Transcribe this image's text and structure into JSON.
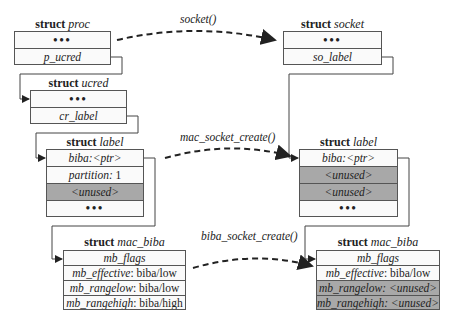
{
  "diagram": {
    "left": {
      "proc": {
        "keyword": "struct",
        "name": "proc",
        "rows": [
          {
            "text": "•••",
            "kind": "dots"
          },
          {
            "text": "p_ucred",
            "kind": "field"
          }
        ]
      },
      "ucred": {
        "keyword": "struct",
        "name": "ucred",
        "rows": [
          {
            "text": "•••",
            "kind": "dots"
          },
          {
            "text": "cr_label",
            "kind": "field"
          }
        ]
      },
      "label": {
        "keyword": "struct",
        "name": "label",
        "rows": [
          {
            "field": "biba: ",
            "value": "<ptr>",
            "kind": "field"
          },
          {
            "field": "partition:",
            "value": " 1",
            "kind": "field"
          },
          {
            "text": "<unused>",
            "kind": "shaded"
          },
          {
            "text": "•••",
            "kind": "dots"
          }
        ]
      },
      "mac_biba": {
        "keyword": "struct",
        "name": "mac_biba",
        "rows": [
          {
            "text": "mb_flags",
            "kind": "field"
          },
          {
            "field": "mb_effective",
            "value": ": biba/low",
            "kind": "field"
          },
          {
            "field": "mb_rangelow",
            "value": ": biba/low",
            "kind": "field"
          },
          {
            "field": "mb_rangehigh",
            "value": ": biba/high",
            "kind": "field"
          }
        ]
      }
    },
    "right": {
      "socket": {
        "keyword": "struct",
        "name": "socket",
        "rows": [
          {
            "text": "•••",
            "kind": "dots"
          },
          {
            "text": "so_label",
            "kind": "field"
          }
        ]
      },
      "label": {
        "keyword": "struct",
        "name": "label",
        "rows": [
          {
            "field": "biba: ",
            "value": "<ptr>",
            "kind": "field"
          },
          {
            "text": "<unused>",
            "kind": "shaded"
          },
          {
            "text": "<unused>",
            "kind": "shaded"
          },
          {
            "text": "•••",
            "kind": "dots"
          }
        ]
      },
      "mac_biba": {
        "keyword": "struct",
        "name": "mac_biba",
        "rows": [
          {
            "text": "mb_flags",
            "kind": "field"
          },
          {
            "field": "mb_effective",
            "value": ": biba/low",
            "kind": "field"
          },
          {
            "text": "mb_rangelow: <unused>",
            "kind": "shaded"
          },
          {
            "text": "mb_rangehigh: <unused>",
            "kind": "shaded"
          }
        ]
      }
    },
    "arrows": {
      "socket": "socket()",
      "mac_socket_create": "mac_socket_create()",
      "biba_socket_create": "biba_socket_create()"
    },
    "colors": {
      "border": "#555555",
      "shaded": "#a8a8a8",
      "box_fill": "#fafafa"
    }
  }
}
